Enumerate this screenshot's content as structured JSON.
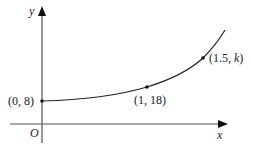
{
  "diagram": {
    "type": "exponential-curve-graph",
    "axes": {
      "x_label": "x",
      "y_label": "y",
      "origin_label": "O"
    },
    "points": [
      {
        "label_open": "(0, 8)",
        "x": 0,
        "y": 8
      },
      {
        "label_open": "(1, 18)",
        "x": 1,
        "y": 18
      },
      {
        "label_prefix": "(1.5, ",
        "label_var": "k",
        "label_suffix": ")",
        "x": 1.5,
        "y": "k"
      }
    ],
    "colors": {
      "axis": "#555555",
      "curve": "#222222",
      "text": "#222222"
    }
  }
}
